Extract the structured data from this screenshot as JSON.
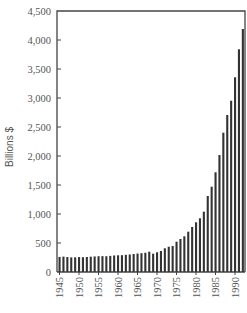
{
  "chart_data": {
    "type": "bar",
    "title": "",
    "xlabel": "",
    "ylabel": "Billions $",
    "ylim": [
      0,
      4500
    ],
    "yticks": [
      0,
      500,
      1000,
      1500,
      2000,
      2500,
      3000,
      3500,
      4000,
      4500
    ],
    "ytick_labels": [
      "0",
      "500",
      "1,000",
      "1,500",
      "2,000",
      "2,500",
      "3,000",
      "3,500",
      "4,000",
      "4,500"
    ],
    "xtick_labels": [
      "1945",
      "1950",
      "1955",
      "1960",
      "1965",
      "1970",
      "1975",
      "1980",
      "1985",
      "1990"
    ],
    "grid": false,
    "legend": null,
    "categories": [
      1945,
      1946,
      1947,
      1948,
      1949,
      1950,
      1951,
      1952,
      1953,
      1954,
      1955,
      1956,
      1957,
      1958,
      1959,
      1960,
      1961,
      1962,
      1963,
      1964,
      1965,
      1966,
      1967,
      1968,
      1969,
      1970,
      1971,
      1972,
      1973,
      1974,
      1975,
      1976,
      1977,
      1978,
      1979,
      1980,
      1981,
      1982,
      1983,
      1984,
      1985,
      1986,
      1987,
      1988,
      1989,
      1990,
      1991,
      1992
    ],
    "values": [
      260,
      265,
      258,
      252,
      253,
      257,
      255,
      259,
      264,
      268,
      272,
      273,
      272,
      278,
      285,
      288,
      290,
      296,
      302,
      310,
      318,
      324,
      332,
      350,
      316,
      340,
      362,
      409,
      436,
      448,
      522,
      569,
      615,
      695,
      776,
      857,
      926,
      1040,
      1310,
      1471,
      1719,
      2017,
      2402,
      2707,
      2953,
      3357,
      3840,
      4190
    ]
  },
  "colors": {
    "bar": "#333333",
    "axis": "#444444",
    "text": "#555555"
  }
}
